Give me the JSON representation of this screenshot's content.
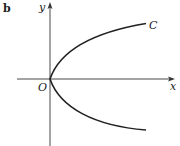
{
  "figure": {
    "panel_label": "b",
    "x_axis_label": "x",
    "y_axis_label": "y",
    "origin_label": "O",
    "curve_label": "C",
    "curve_description": "Parabola opening to the right with vertex at origin O"
  }
}
